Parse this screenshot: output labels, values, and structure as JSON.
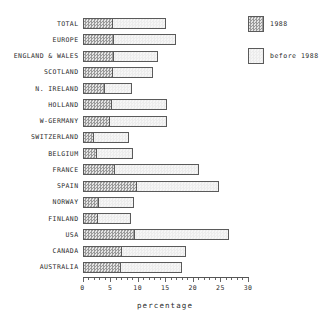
{
  "chart_data": {
    "type": "bar",
    "orientation": "horizontal",
    "stacked": true,
    "title": "",
    "xlabel": "percentage",
    "ylabel": "",
    "xlim": [
      0,
      30
    ],
    "xticks": [
      0,
      5,
      10,
      15,
      20,
      25,
      30
    ],
    "xtick_labels": [
      "0",
      "5",
      "10",
      "15",
      "20",
      "25",
      "30"
    ],
    "minor_tick_step": 1,
    "grid": false,
    "legend_position": "top-right",
    "categories": [
      "TOTAL",
      "EUROPE",
      "ENGLAND & WALES",
      "SCOTLAND",
      "N. IRELAND",
      "HOLLAND",
      "W-GERMANY",
      "SWITZERLAND",
      "BELGIUM",
      "FRANCE",
      "SPAIN",
      "NORWAY",
      "FINLAND",
      "USA",
      "CANADA",
      "AUSTRALIA"
    ],
    "series": [
      {
        "name": "1988",
        "fill": "dark-checker",
        "color": "#9a9a9a",
        "values": [
          5.5,
          5.8,
          5.7,
          5.5,
          4.1,
          5.4,
          5.0,
          2.1,
          2.6,
          5.9,
          9.9,
          3.0,
          2.8,
          9.6,
          7.2,
          7.0
        ]
      },
      {
        "name": "before 1988",
        "fill": "light",
        "color": "#f1f1f1",
        "values": [
          9.7,
          11.2,
          8.0,
          7.3,
          4.8,
          9.9,
          10.3,
          6.3,
          6.5,
          15.2,
          14.8,
          6.4,
          6.0,
          16.9,
          11.5,
          11.0
        ]
      }
    ],
    "totals": [
      15.2,
      17.0,
      13.7,
      12.8,
      8.9,
      15.3,
      15.3,
      8.4,
      9.1,
      21.1,
      24.7,
      9.4,
      8.8,
      26.5,
      18.7,
      18.0
    ]
  },
  "legend": {
    "items": [
      {
        "label": "1988"
      },
      {
        "label": "before 1988"
      }
    ]
  },
  "colors": {
    "axis": "#555555",
    "text": "#2b2b2b",
    "bar_outline": "#5a5a5a",
    "series_1988": "#9a9a9a",
    "series_before_1988": "#f1f1f1",
    "background": "#ffffff"
  }
}
